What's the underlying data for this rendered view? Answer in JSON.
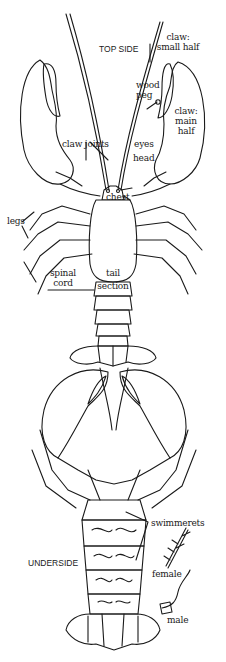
{
  "diagram": {
    "top_view": {
      "heading": "TOP SIDE",
      "labels": {
        "claw_small_half": [
          "claw:",
          "small half"
        ],
        "wood_peg": [
          "wood",
          "peg"
        ],
        "claw_main_half": [
          "claw:",
          "main",
          "half"
        ],
        "claw_joints": "claw joints",
        "eyes": "eyes",
        "head": "head",
        "chest": "chest",
        "legs": "legs",
        "spinal_cord": [
          "spinal",
          "cord"
        ],
        "tail_section": [
          "tail",
          "section"
        ]
      }
    },
    "under_view": {
      "heading": "UNDERSIDE",
      "labels": {
        "swimmerets": "swimmerets",
        "female": "female",
        "male": "male"
      }
    }
  }
}
